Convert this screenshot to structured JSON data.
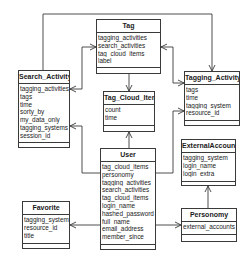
{
  "diagram": {
    "type": "uml-class-diagram",
    "classes": {
      "tag": {
        "name": "Tag",
        "attributes": [
          "tagging_activities",
          "search_activities",
          "tag_cloud_items",
          "label"
        ]
      },
      "search_activity": {
        "name": "Search_Activity",
        "attributes": [
          "tagging_activities",
          "tags",
          "time",
          "sorty_by",
          "my_data_only",
          "tagging_systems",
          "session_id"
        ]
      },
      "tagging_activity": {
        "name": "Tagging_Activity",
        "attributes": [
          "tags",
          "time",
          "tagging_system",
          "resource_id"
        ]
      },
      "tag_cloud_item": {
        "name": "Tag_Cloud_Item",
        "attributes": [
          "count",
          "time"
        ]
      },
      "user": {
        "name": "User",
        "attributes": [
          "tag_cloud_items",
          "personomy",
          "tagging_activities",
          "search_activities",
          "tag_cloud_items",
          "login_name",
          "hashed_password",
          "full_name",
          "email_address",
          "member_since"
        ]
      },
      "external_account": {
        "name": "ExternalAccount",
        "attributes": [
          "tagging_system",
          "login_name",
          "login_extra"
        ]
      },
      "favorite": {
        "name": "Favorite",
        "attributes": [
          "tagging_system",
          "resource_id",
          "title"
        ]
      },
      "personomy": {
        "name": "Personomy",
        "attributes": [
          "external_accounts"
        ]
      }
    },
    "associations": [
      {
        "from": "Search_Activity",
        "to": "Tagging_Activity",
        "arrow": "to"
      },
      {
        "from": "Tag",
        "to": "Search_Activity",
        "arrow": "both"
      },
      {
        "from": "Tag",
        "to": "Tagging_Activity",
        "arrow": "both"
      },
      {
        "from": "Tag",
        "to": "Tag_Cloud_Item",
        "arrow": "to"
      },
      {
        "from": "User",
        "to": "Tag_Cloud_Item",
        "arrow": "to"
      },
      {
        "from": "User",
        "to": "Search_Activity",
        "arrow": "to"
      },
      {
        "from": "User",
        "to": "Tagging_Activity",
        "arrow": "to"
      },
      {
        "from": "User",
        "to": "Favorite",
        "arrow": "to"
      },
      {
        "from": "User",
        "to": "Personomy",
        "arrow": "to"
      },
      {
        "from": "Personomy",
        "to": "ExternalAccount",
        "arrow": "to"
      }
    ],
    "colors": {
      "line": "#3a3a3a",
      "background": "#ffffff",
      "text": "#1a1a1a"
    }
  }
}
